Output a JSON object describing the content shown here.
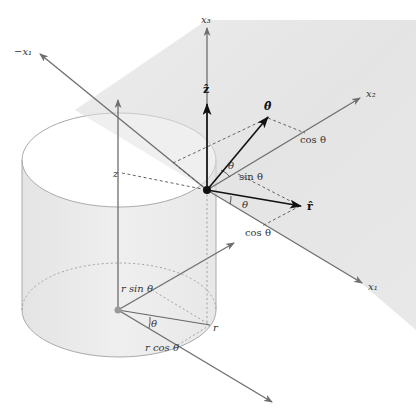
{
  "diagram": {
    "colors": {
      "background": "#ffffff",
      "plane_fill": "#e6e6e6",
      "cylinder_fill": "#ebebeb",
      "axis": "#6e6e6e",
      "vector": "#111111",
      "origin_dot": "#111111",
      "base_dot": "#999999"
    },
    "axes": {
      "x1": "x₁",
      "neg_x1": "−x₁",
      "x2": "x₂",
      "x3": "x₃"
    },
    "unit_vectors": {
      "z_hat": "ẑ",
      "theta_hat": "θ̂",
      "r_hat": "r̂"
    },
    "labels": {
      "z": "z",
      "theta_upper": "θ",
      "theta_lower": "θ",
      "theta_base": "θ",
      "sin_theta": "sin θ",
      "cos_theta_upper": "cos θ",
      "cos_theta_lower": "cos θ",
      "r_sin_theta": "r sin θ",
      "r_cos_theta": "r cos θ",
      "r": "r"
    }
  }
}
